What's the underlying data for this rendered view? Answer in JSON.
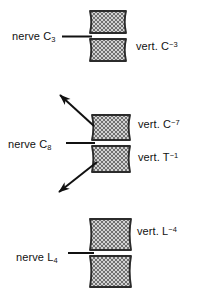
{
  "figure": {
    "background_color": "#ffffff",
    "ink_color": "#111111",
    "vertebra_fill_color": "#c9c9c9",
    "vertebra_border_color": "#2b2b2b"
  },
  "groups": [
    {
      "name": "cervical-upper",
      "nerve_label": {
        "text": "nerve C",
        "sub": "3"
      },
      "vertebra_labels": [
        {
          "text": "vert. C",
          "sup": "−3"
        }
      ],
      "vertebrae_count": 2,
      "has_arrows": false
    },
    {
      "name": "cervicothoracic-junction",
      "nerve_label": {
        "text": "nerve C",
        "sub": "8"
      },
      "vertebra_labels": [
        {
          "text": "vert. C",
          "sup": "−7"
        },
        {
          "text": "vert. T",
          "sup": "−1"
        }
      ],
      "vertebrae_count": 2,
      "has_arrows": true,
      "arrows": [
        {
          "name": "arrow-upper-left",
          "direction": "up-left"
        },
        {
          "name": "arrow-lower-left",
          "direction": "down-left"
        }
      ]
    },
    {
      "name": "lumbar",
      "nerve_label": {
        "text": "nerve L",
        "sub": "4"
      },
      "vertebra_labels": [
        {
          "text": "vert. L",
          "sup": "−4"
        }
      ],
      "vertebrae_count": 2,
      "has_arrows": false
    }
  ],
  "labels": {
    "nerve_c3_text": "nerve C",
    "nerve_c3_sub": "3",
    "vert_c3_text": "vert. C",
    "vert_c3_sup": "−3",
    "nerve_c8_text": "nerve C",
    "nerve_c8_sub": "8",
    "vert_c7_text": "vert. C",
    "vert_c7_sup": "−7",
    "vert_t1_text": "vert. T",
    "vert_t1_sup": "−1",
    "nerve_l4_text": "nerve L",
    "nerve_l4_sub": "4",
    "vert_l4_text": "vert. L",
    "vert_l4_sup": "−4"
  }
}
